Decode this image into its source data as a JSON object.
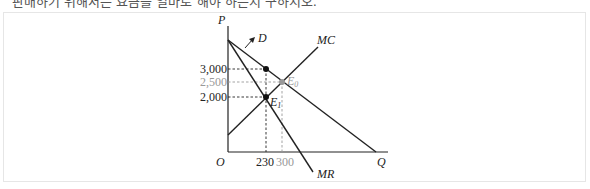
{
  "header": {
    "text": "판매하기 위해서는 요금을 얼마로 해야 하는지 구하시오."
  },
  "diagram": {
    "axes": {
      "y_label": "P",
      "x_label": "Q",
      "origin_label": "O"
    },
    "curves": {
      "demand": "D",
      "marginal_revenue": "MR",
      "marginal_cost": "MC"
    },
    "y_ticks": [
      "3,000",
      "2,500",
      "2,000"
    ],
    "x_ticks": [
      "230",
      "300"
    ],
    "points": {
      "e0": "E",
      "e0_sub": "0",
      "e1": "E",
      "e1_sub": "1"
    },
    "colors": {
      "line": "#222222",
      "gray": "#999999"
    }
  }
}
